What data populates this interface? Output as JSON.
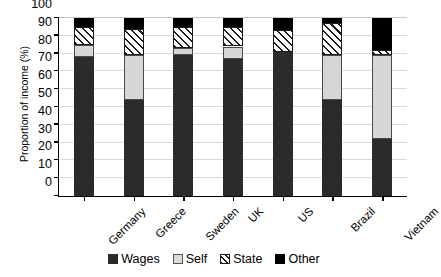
{
  "chart_data": {
    "type": "bar",
    "stacked": true,
    "title": "",
    "xlabel": "",
    "ylabel": "Proportion of income (%)",
    "ylim": [
      0,
      100
    ],
    "yticks": [
      0,
      10,
      20,
      30,
      40,
      50,
      60,
      70,
      80,
      90,
      100
    ],
    "grid": true,
    "legend_position": "bottom",
    "categories": [
      "Germany",
      "Greece",
      "Sweden",
      "UK",
      "US",
      "Brazil",
      "Vietnam"
    ],
    "series": [
      {
        "name": "Wages",
        "color": "#2b2b2b",
        "values": [
          78,
          54,
          79,
          77,
          81,
          54,
          32
        ]
      },
      {
        "name": "Self",
        "color": "#d6d6d6",
        "values": [
          7,
          25,
          4,
          7,
          0,
          25,
          47
        ]
      },
      {
        "name": "State",
        "color": "#ffffff",
        "pattern": "diagonal-hatch",
        "values": [
          10,
          15,
          12,
          11,
          12,
          18,
          3
        ]
      },
      {
        "name": "Other",
        "color": "#000000",
        "values": [
          5,
          6,
          5,
          5,
          7,
          3,
          18
        ]
      }
    ]
  },
  "axis": {
    "y_title": "Proportion of income (%)",
    "y_tick_labels": [
      "100",
      "90",
      "80",
      "70",
      "60",
      "50",
      "40",
      "30",
      "20",
      "10",
      "0"
    ],
    "x_tick_labels": [
      "Germany",
      "Greece",
      "Sweden",
      "UK",
      "US",
      "Brazil",
      "Vietnam"
    ]
  },
  "legend": {
    "items": [
      {
        "label": "Wages",
        "swatch": "wages"
      },
      {
        "label": "Self",
        "swatch": "self"
      },
      {
        "label": "State",
        "swatch": "state"
      },
      {
        "label": "Other",
        "swatch": "other"
      }
    ]
  }
}
